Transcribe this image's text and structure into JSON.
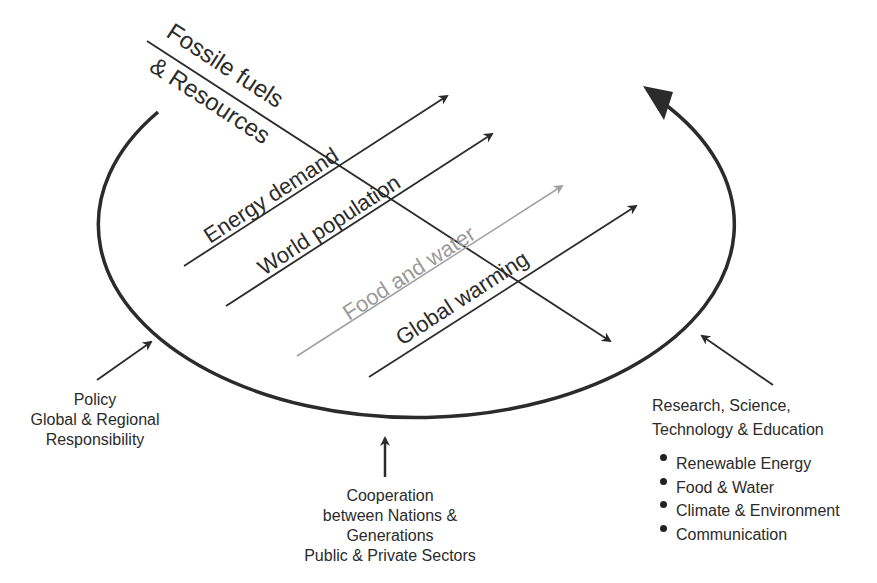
{
  "diagram": {
    "trends": {
      "fossil": {
        "line1": "Fossile fuels",
        "line2": "& Resources"
      },
      "energy": "Energy demand",
      "population": "World population",
      "food": "Food and water",
      "warming": "Global warming"
    },
    "drivers": {
      "policy": [
        "Policy",
        "Global & Regional",
        "Responsibility"
      ],
      "cooperation": [
        "Cooperation",
        "between Nations &",
        "Generations",
        "Public & Private Sectors"
      ],
      "research": [
        "Research, Science,",
        "Technology & Education"
      ]
    },
    "research_topics": [
      "Renewable Energy",
      "Food & Water",
      "Climate & Environment",
      "Communication"
    ],
    "colors": {
      "ink": "#2b2b2b",
      "food_gray": "#9a9a9a"
    }
  }
}
